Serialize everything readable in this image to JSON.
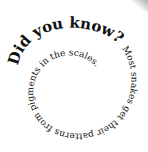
{
  "spiral": {
    "heading": "Did you know?",
    "body": "Most snakes get their patterns from pigments in the scales.",
    "text_color": "#111111",
    "background": "#ffffff"
  },
  "decorations": {
    "corner_shape": "gray-page-curl-corner"
  }
}
